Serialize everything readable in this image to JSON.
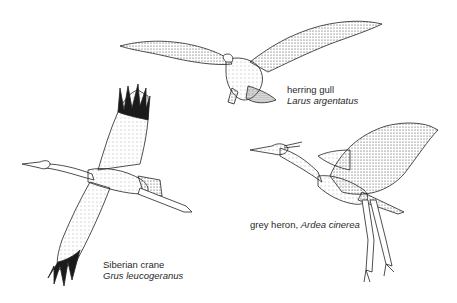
{
  "illustration": {
    "style": "stippled pen-and-ink",
    "ink_color": "#1e1e1e",
    "background": "#ffffff"
  },
  "birds": [
    {
      "id": "herring-gull",
      "common_name": "herring gull",
      "scientific_name": "Larus argentatus"
    },
    {
      "id": "siberian-crane",
      "common_name": "Siberian crane",
      "scientific_name": "Grus leucogeranus"
    },
    {
      "id": "grey-heron",
      "common_name": "grey heron,",
      "scientific_name": "Ardea cinerea"
    }
  ]
}
